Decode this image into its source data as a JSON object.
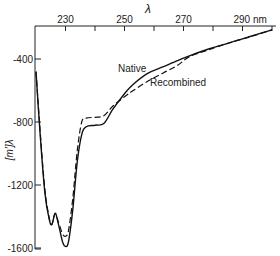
{
  "chart_data": {
    "type": "line",
    "title": "",
    "xlabel": "λ",
    "x_unit_label": "nm",
    "ylabel": "[m′]λ",
    "xlim": [
      220,
      300
    ],
    "ylim": [
      -1600,
      -190
    ],
    "x_ticks": [
      220,
      230,
      240,
      250,
      260,
      270,
      280,
      290,
      300
    ],
    "x_tick_labels": [
      {
        "value": 230,
        "label": "230"
      },
      {
        "value": 250,
        "label": "250"
      },
      {
        "value": 270,
        "label": "270"
      },
      {
        "value": 290,
        "label": "290 nm"
      }
    ],
    "y_ticks": [
      -400,
      -800,
      -1200,
      -1600
    ],
    "y_tick_labels": [
      "-400",
      "-800",
      "-1200",
      "-1600"
    ],
    "x_axis_position": "top",
    "grid": false,
    "legend": "inline-labels",
    "series": [
      {
        "name": "Native",
        "style": "solid",
        "x": [
          220,
          221.5,
          223,
          224.5,
          225.4,
          226.5,
          227.5,
          229,
          230,
          231,
          232.5,
          234,
          235.5,
          237,
          240,
          243,
          246,
          250,
          253,
          258,
          263,
          268,
          272,
          278,
          285,
          292,
          300
        ],
        "y": [
          -480,
          -900,
          -1250,
          -1420,
          -1450,
          -1380,
          -1440,
          -1560,
          -1590,
          -1560,
          -1350,
          -1050,
          -880,
          -830,
          -820,
          -810,
          -720,
          -620,
          -560,
          -490,
          -450,
          -410,
          -380,
          -340,
          -300,
          -260,
          -215
        ]
      },
      {
        "name": "Recombined",
        "style": "dashed",
        "x": [
          220,
          221.5,
          223,
          224.5,
          225.4,
          226.5,
          227.5,
          229,
          230,
          231,
          232.5,
          234,
          235.5,
          237,
          240,
          243,
          246,
          250,
          253,
          258,
          263,
          268,
          272,
          278,
          285,
          292,
          300
        ],
        "y": [
          -480,
          -880,
          -1230,
          -1410,
          -1450,
          -1380,
          -1430,
          -1510,
          -1525,
          -1490,
          -1280,
          -980,
          -800,
          -775,
          -770,
          -760,
          -700,
          -640,
          -600,
          -540,
          -490,
          -440,
          -385,
          -345,
          -300,
          -262,
          -215
        ]
      }
    ],
    "annotations": [
      {
        "text": "Native",
        "series": "Native"
      },
      {
        "text": "Recombined",
        "series": "Recombined"
      }
    ]
  }
}
